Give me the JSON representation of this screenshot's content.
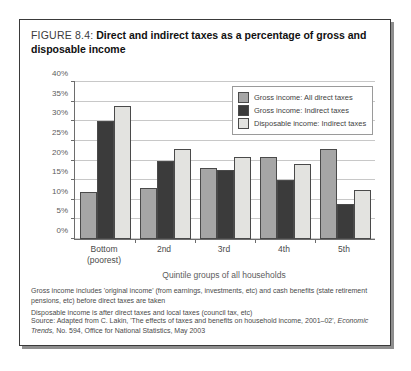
{
  "figure": {
    "number": "FIGURE 8.4:",
    "title": "Direct and indirect taxes as a percentage of gross and disposable income"
  },
  "chart_data": {
    "type": "bar",
    "title": "Direct and indirect taxes as a percentage of gross and disposable income",
    "xlabel": "Quintile groups of all households",
    "ylabel": "",
    "ylim": [
      0,
      40
    ],
    "grid": true,
    "legend_position": "top-right",
    "categories": [
      "Bottom (poorest)",
      "2nd",
      "3rd",
      "4th",
      "5th"
    ],
    "ytick_labels": [
      "0%",
      "5%",
      "10%",
      "15%",
      "20%",
      "25%",
      "30%",
      "35%",
      "40%"
    ],
    "ytick_values": [
      0,
      5,
      10,
      15,
      20,
      25,
      30,
      35,
      40
    ],
    "series": [
      {
        "name": "Gross income: All direct taxes",
        "color": "#a6a6a6",
        "values": [
          12,
          13,
          18,
          21,
          23
        ]
      },
      {
        "name": "Gross income: Indirect taxes",
        "color": "#3b3b3b",
        "values": [
          30,
          20,
          17.5,
          15,
          9
        ]
      },
      {
        "name": "Disposable income: Indirect taxes",
        "color": "#e3e3e0",
        "values": [
          34,
          23,
          21,
          19,
          12.5
        ]
      }
    ]
  },
  "notes": [
    "Gross income includes 'original income' (from earnings, investments, etc) and cash benefits (state retirement pensions, etc) before direct taxes are taken",
    "Disposable income is after direct taxes and local taxes (council tax, etc)"
  ],
  "source": {
    "prefix": "Source: Adapted from C. Lakin, 'The effects of taxes and benefits on household income, 2001–02', ",
    "publication": "Economic Trends,",
    "suffix": " No. 594, Office for National Statistics, May 2003"
  }
}
